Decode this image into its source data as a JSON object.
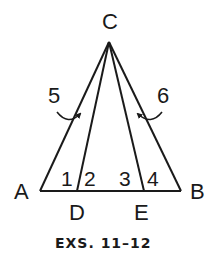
{
  "diagram": {
    "vertices": {
      "C": {
        "label": "C",
        "x": 109,
        "y": 42
      },
      "A": {
        "label": "A",
        "x": 40,
        "y": 191
      },
      "B": {
        "label": "B",
        "x": 181,
        "y": 191
      },
      "D": {
        "label": "D",
        "x": 77,
        "y": 191
      },
      "E": {
        "label": "E",
        "x": 144,
        "y": 191
      }
    },
    "segments": [
      {
        "from": "C",
        "to": "A"
      },
      {
        "from": "C",
        "to": "B"
      },
      {
        "from": "C",
        "to": "D"
      },
      {
        "from": "C",
        "to": "E"
      },
      {
        "from": "A",
        "to": "B"
      }
    ],
    "angle_labels": {
      "a1": "1",
      "a2": "2",
      "a3": "3",
      "a4": "4",
      "a5": "5",
      "a6": "6"
    },
    "caption": "EXS. 11–12",
    "stroke_color": "#1a1a1a",
    "background": "#ffffff"
  }
}
